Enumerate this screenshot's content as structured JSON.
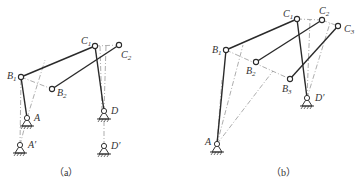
{
  "figure_a": {
    "caption": "（a）",
    "labels": {
      "B1": "B",
      "B1_sub": "1",
      "B2": "B",
      "B2_sub": "2",
      "C1": "C",
      "C1_sub": "1",
      "C2": "C",
      "C2_sub": "2",
      "A": "A",
      "A_prime": "A′",
      "D": "D",
      "D_prime": "D′"
    }
  },
  "figure_b": {
    "caption": "（b）",
    "labels": {
      "B1": "B",
      "B1_sub": "1",
      "B2": "B",
      "B2_sub": "2",
      "B3": "B",
      "B3_sub": "3",
      "C1": "C",
      "C1_sub": "1",
      "C2": "C",
      "C2_sub": "2",
      "C3": "C",
      "C3_sub": "3",
      "A": "A",
      "D_prime": "D′"
    }
  }
}
